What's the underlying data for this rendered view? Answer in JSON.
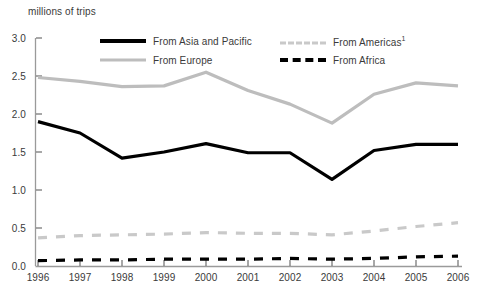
{
  "chart_data": {
    "type": "line",
    "title": "",
    "ylabel": "millions of trips",
    "xlabel": "",
    "ylim": [
      0.0,
      3.0
    ],
    "ytick_labels": [
      "0.0",
      "0.5",
      "1.0",
      "1.5",
      "2.0",
      "2.5",
      "3.0"
    ],
    "ytick_values": [
      0.0,
      0.5,
      1.0,
      1.5,
      2.0,
      2.5,
      3.0
    ],
    "grid": false,
    "legend_position": "top-inside",
    "categories": [
      "1996",
      "1997",
      "1998",
      "1999",
      "2000",
      "2001",
      "2002",
      "2003",
      "2004",
      "2005",
      "2006"
    ],
    "x": [
      1996,
      1997,
      1998,
      1999,
      2000,
      2001,
      2002,
      2003,
      2004,
      2005,
      2006
    ],
    "series": [
      {
        "name": "From Asia and Pacific",
        "style": "solid",
        "color": "#000000",
        "width": 3.2,
        "values": [
          1.9,
          1.75,
          1.42,
          1.5,
          1.61,
          1.49,
          1.49,
          1.14,
          1.52,
          1.6,
          1.6
        ]
      },
      {
        "name": "From Europe",
        "style": "solid",
        "color": "#bdbdbd",
        "width": 3.2,
        "values": [
          2.48,
          2.43,
          2.36,
          2.37,
          2.55,
          2.31,
          2.13,
          1.88,
          2.26,
          2.41,
          2.37
        ]
      },
      {
        "name": "From Americas",
        "footnote": "1",
        "style": "dashed",
        "color": "#c9c9c9",
        "width": 3.2,
        "values": [
          0.37,
          0.4,
          0.41,
          0.42,
          0.44,
          0.43,
          0.43,
          0.41,
          0.46,
          0.52,
          0.57
        ]
      },
      {
        "name": "From Africa",
        "style": "dashed",
        "color": "#000000",
        "width": 3.2,
        "values": [
          0.07,
          0.08,
          0.08,
          0.09,
          0.09,
          0.09,
          0.1,
          0.09,
          0.1,
          0.12,
          0.13
        ]
      }
    ]
  },
  "legend": [
    {
      "label": "From Asia and Pacific",
      "sup": ""
    },
    {
      "label": "From Europe",
      "sup": ""
    },
    {
      "label": "From Americas",
      "sup": "1"
    },
    {
      "label": "From Africa",
      "sup": ""
    }
  ],
  "colors": {
    "asia_pacific": "#000000",
    "europe": "#bdbdbd",
    "americas": "#c9c9c9",
    "africa": "#000000",
    "axis": "#9a9a9a",
    "text": "#3a3a3a",
    "background": "#ffffff"
  }
}
